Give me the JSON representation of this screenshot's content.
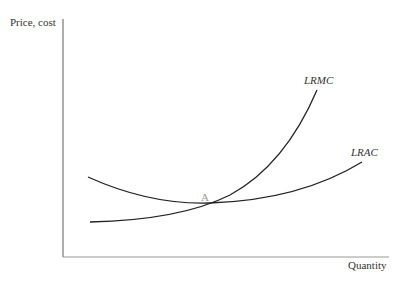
{
  "diagram": {
    "y_axis_label": "Price, cost",
    "x_axis_label": "Quantity",
    "curves": [
      {
        "name": "LRMC",
        "label": "LRMC"
      },
      {
        "name": "LRAC",
        "label": "LRAC"
      }
    ],
    "point_label": "A",
    "colors": {
      "curve": "#222222",
      "axis": "#777777",
      "point": "#999999"
    }
  }
}
